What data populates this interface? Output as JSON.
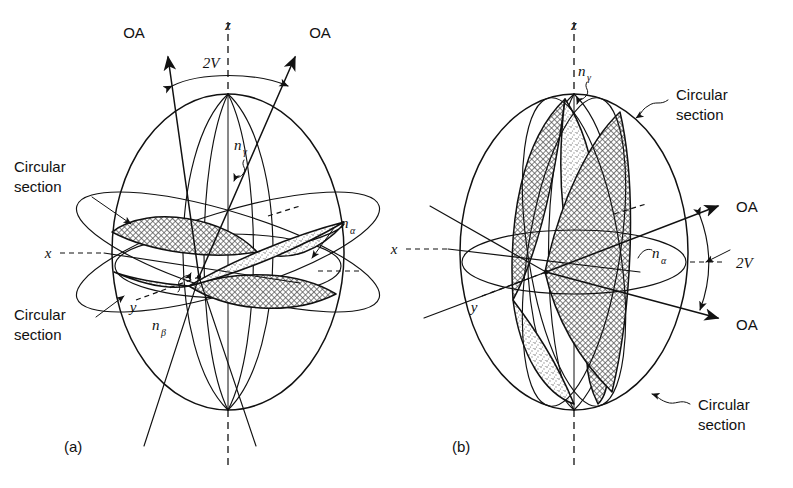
{
  "figure": {
    "title_absent": true,
    "background_color": "#ffffff",
    "ink_color": "#111111",
    "shading_light": "#e2e2e2",
    "shading_dark": "#c9c9c9",
    "panels": [
      {
        "id": "a",
        "panel_label": "(a)",
        "description": "Biaxial indicatrix, optic axial plane containing z and x, acute bisectrix z; optic axes lie near z",
        "axes": [
          {
            "name": "z-axis-label",
            "text": "z"
          },
          {
            "name": "x-axis-label",
            "text": "x"
          },
          {
            "name": "y-axis-label",
            "text": "y"
          }
        ],
        "optic_axes": [
          {
            "name": "optic-axis-left",
            "text": "OA"
          },
          {
            "name": "optic-axis-right",
            "text": "OA"
          }
        ],
        "angle_label": "2V",
        "index_labels": [
          {
            "name": "n-gamma",
            "base": "n",
            "sub": "γ"
          },
          {
            "name": "n-beta",
            "base": "n",
            "sub": "β"
          },
          {
            "name": "n-alpha",
            "base": "n",
            "sub": "α"
          }
        ],
        "callouts": [
          {
            "name": "circular-section-upper",
            "line1": "Circular",
            "line2": "section"
          },
          {
            "name": "circular-section-lower",
            "line1": "Circular",
            "line2": "section"
          }
        ]
      },
      {
        "id": "b",
        "panel_label": "(b)",
        "description": "Biaxial indicatrix, optic axial plane containing x and y, acute bisectrix x; optic axes lie near x to the right",
        "axes": [
          {
            "name": "z-axis-label",
            "text": "z"
          },
          {
            "name": "x-axis-label",
            "text": "x"
          },
          {
            "name": "y-axis-label",
            "text": "y"
          }
        ],
        "optic_axes": [
          {
            "name": "optic-axis-upper",
            "text": "OA"
          },
          {
            "name": "optic-axis-lower",
            "text": "OA"
          }
        ],
        "angle_label": "2V",
        "index_labels": [
          {
            "name": "n-gamma",
            "base": "n",
            "sub": "γ"
          },
          {
            "name": "n-alpha",
            "base": "n",
            "sub": "α"
          }
        ],
        "callouts": [
          {
            "name": "circular-section-upper",
            "line1": "Circular",
            "line2": "section"
          },
          {
            "name": "circular-section-lower",
            "line1": "Circular",
            "line2": "section"
          }
        ]
      }
    ]
  }
}
